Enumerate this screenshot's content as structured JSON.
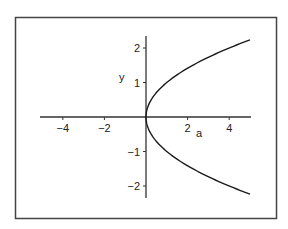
{
  "chart_data": {
    "type": "line",
    "title": "",
    "xlabel": "a",
    "ylabel": "y",
    "xlim": [
      -5,
      5
    ],
    "ylim": [
      -2.24,
      2.24
    ],
    "grid": false,
    "legend": null,
    "x_ticks": [
      -4,
      -2,
      2,
      4
    ],
    "x_tick_labels": [
      "−4",
      "−2",
      "2",
      "4"
    ],
    "y_ticks": [
      -2,
      -1,
      1,
      2
    ],
    "y_tick_labels": [
      "−2",
      "−1",
      "1",
      "2"
    ],
    "series": [
      {
        "name": "y^2 = a",
        "description": "Parabola opening to the right, a = y^2, for y in [-sqrt(5), sqrt(5)]",
        "x": [
          5,
          4,
          3,
          2,
          1,
          0.5,
          0.25,
          0,
          0.25,
          0.5,
          1,
          2,
          3,
          4,
          5
        ],
        "y": [
          -2.236,
          -2,
          -1.732,
          -1.414,
          -1,
          -0.707,
          -0.5,
          0,
          0.5,
          0.707,
          1,
          1.414,
          1.732,
          2,
          2.236
        ]
      }
    ],
    "colors": {
      "curve": "#1a1a1a",
      "axes": "#333333",
      "frame": "#444444",
      "background": "#ffffff"
    }
  }
}
